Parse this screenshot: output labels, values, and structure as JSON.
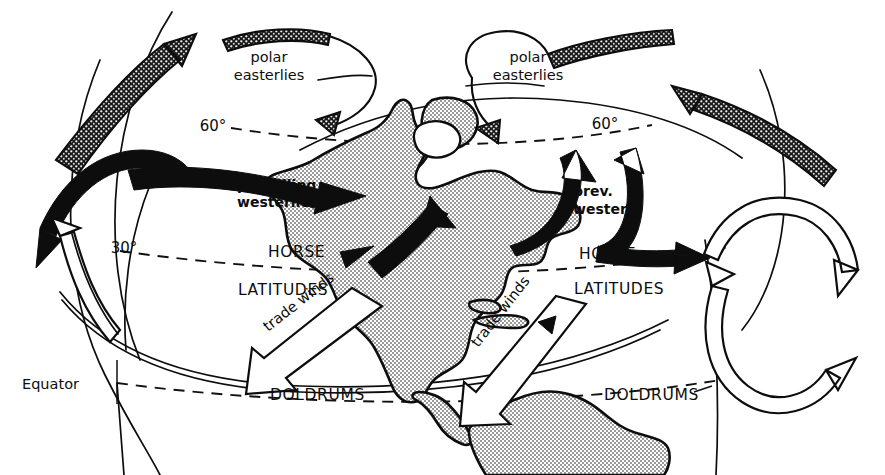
{
  "figure": {
    "type": "schematic-diagram",
    "background_color": "#ffffff",
    "ink_color": "#0d0d0d",
    "land_fill": "stipple-gray"
  },
  "labels": {
    "polar_easterlies_left": "polar\neasterlies",
    "polar_easterlies_left_line1": "polar",
    "polar_easterlies_left_line2": "easterlies",
    "polar_easterlies_right_line1": "polar",
    "polar_easterlies_right_line2": "easterlies",
    "prevailing_westerlies_line1": "prevailing",
    "prevailing_westerlies_line2": "westerlies",
    "prev_westerl_line1": "prev.",
    "prev_westerl_line2": "westerl.",
    "horse_left_line1": "HORSE",
    "horse_left_line2": "LATITUDES",
    "horse_right_line1": "HORSE",
    "horse_right_line2": "LATITUDES",
    "doldrums_left": "DOLDRUMS",
    "doldrums_right": "DOLDRUMS",
    "trade_winds_left": "trade winds",
    "trade_winds_right": "trade winds",
    "equator": "Equator",
    "lat_60_left": "60°",
    "lat_60_right": "60°",
    "lat_30_left": "30°"
  },
  "latitude_lines": [
    {
      "name": "60-north",
      "label": "60°",
      "style": "dashed"
    },
    {
      "name": "30-north",
      "label": "30°",
      "style": "dashed"
    },
    {
      "name": "equator",
      "label": "Equator",
      "style": "dashed"
    }
  ],
  "wind_belts": [
    {
      "name": "polar-easterlies",
      "label": "polar easterlies",
      "arrow_style": "stippled",
      "hemisphere": "north",
      "count": 2
    },
    {
      "name": "prevailing-westerlies",
      "label": "prevailing westerlies",
      "arrow_style": "solid-black",
      "hemisphere": "north",
      "count": 2
    },
    {
      "name": "trade-winds",
      "label": "trade winds",
      "arrow_style": "open-white",
      "hemisphere": "north",
      "count": 2
    }
  ],
  "pressure_belts": [
    {
      "name": "horse-latitudes",
      "label": "HORSE LATITUDES",
      "latitude": "30°"
    },
    {
      "name": "doldrums",
      "label": "DOLDRUMS",
      "latitude": "0°"
    }
  ],
  "cells": [
    {
      "name": "hadley-cell-left",
      "arrow_style": "open-white"
    },
    {
      "name": "ferrel-cell-right",
      "arrow_style": "open-white"
    },
    {
      "name": "hadley-cell-right",
      "arrow_style": "open-white"
    }
  ],
  "landmasses": [
    {
      "name": "north-america",
      "fill": "stipple"
    },
    {
      "name": "south-america",
      "fill": "stipple"
    },
    {
      "name": "greenland",
      "fill": "stipple"
    },
    {
      "name": "caribbean-islands",
      "fill": "stipple"
    }
  ]
}
